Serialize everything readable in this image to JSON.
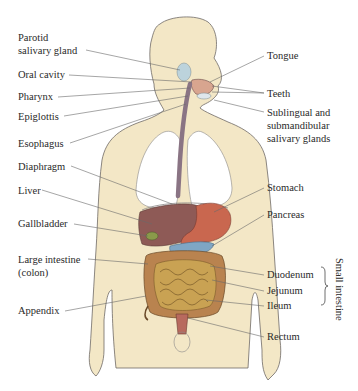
{
  "diagram": {
    "colors": {
      "skin": "#f3e7c6",
      "outline": "#6e6a66",
      "lungs": "#ffffff",
      "esophagus": "#8a7484",
      "liver": "#8e5a56",
      "stomach": "#c9674f",
      "pancreas": "#7fa6c4",
      "intestine": "#c9a253",
      "colon": "#b9834f",
      "parotid": "#bcd3dc",
      "rectum": "#b86a5e",
      "leader": "#6a6a6a"
    },
    "labels_left": [
      {
        "id": "parotid",
        "line1": "Parotid",
        "line2": "salivary gland"
      },
      {
        "id": "oral-cavity",
        "line1": "Oral cavity"
      },
      {
        "id": "pharynx",
        "line1": "Pharynx"
      },
      {
        "id": "epiglottis",
        "line1": "Epiglottis"
      },
      {
        "id": "esophagus",
        "line1": "Esophagus"
      },
      {
        "id": "diaphragm",
        "line1": "Diaphragm"
      },
      {
        "id": "liver",
        "line1": "Liver"
      },
      {
        "id": "gallbladder",
        "line1": "Gallbladder"
      },
      {
        "id": "large-intestine",
        "line1": "Large intestine",
        "line2": "(colon)"
      },
      {
        "id": "appendix",
        "line1": "Appendix"
      }
    ],
    "labels_right": [
      {
        "id": "tongue",
        "line1": "Tongue"
      },
      {
        "id": "teeth",
        "line1": "Teeth"
      },
      {
        "id": "salivary",
        "line1": "Sublingual and",
        "line2": "submandibular",
        "line3": "salivary glands"
      },
      {
        "id": "stomach",
        "line1": "Stomach"
      },
      {
        "id": "pancreas",
        "line1": "Pancreas"
      },
      {
        "id": "duodenum",
        "line1": "Duodenum"
      },
      {
        "id": "jejunum",
        "line1": "Jejunum"
      },
      {
        "id": "ileum",
        "line1": "Ileum"
      },
      {
        "id": "rectum",
        "line1": "Rectum"
      }
    ],
    "group_label": "Small intestine"
  }
}
